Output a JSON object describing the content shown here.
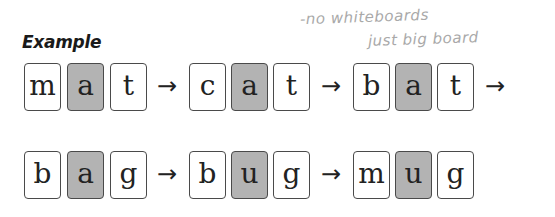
{
  "heading": "Example",
  "handwritten_note": {
    "line1": "-no whiteboards",
    "line2": "just big board"
  },
  "arrow_glyph": "→",
  "highlight_color": "#b3b3b3",
  "rows": [
    {
      "words": [
        {
          "letters": [
            "m",
            "a",
            "t"
          ],
          "highlight_index": 1
        },
        {
          "letters": [
            "c",
            "a",
            "t"
          ],
          "highlight_index": 1
        },
        {
          "letters": [
            "b",
            "a",
            "t"
          ],
          "highlight_index": 1
        }
      ],
      "trailing_arrow": true
    },
    {
      "words": [
        {
          "letters": [
            "b",
            "a",
            "g"
          ],
          "highlight_index": 1
        },
        {
          "letters": [
            "b",
            "u",
            "g"
          ],
          "highlight_index": 1
        },
        {
          "letters": [
            "m",
            "u",
            "g"
          ],
          "highlight_index": 1
        }
      ],
      "trailing_arrow": false
    }
  ]
}
